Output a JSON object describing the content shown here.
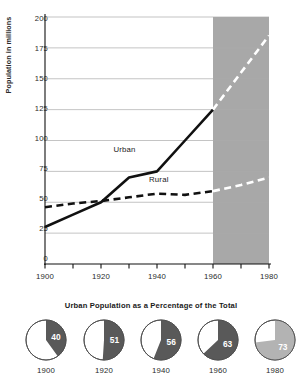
{
  "chart_data": [
    {
      "type": "line",
      "title": "",
      "xlabel": "",
      "ylabel": "Population in millions",
      "xlim": [
        1900,
        1980
      ],
      "ylim": [
        0,
        200
      ],
      "grid": true,
      "yticks": [
        0,
        25,
        50,
        75,
        100,
        125,
        150,
        175,
        200
      ],
      "ytick_labels": [
        "0",
        "25",
        "50",
        "75",
        "100",
        "125",
        "150",
        "175",
        "200"
      ],
      "xticks": [
        1900,
        1910,
        1920,
        1930,
        1940,
        1950,
        1960,
        1970,
        1980
      ],
      "xtick_labels": [
        "1900",
        "1920",
        "1940",
        "1960",
        "1980"
      ],
      "xtick_label_values": [
        1900,
        1920,
        1940,
        1960,
        1980
      ],
      "projection_band": {
        "from": 1960,
        "to": 1980,
        "color": "#a8a8a8"
      },
      "series": [
        {
          "name": "Urban",
          "style": "solid",
          "color": "#111111",
          "projected_style": "dashed",
          "projected_color": "#ffffff",
          "x": [
            1900,
            1910,
            1920,
            1930,
            1940,
            1950,
            1960,
            1970,
            1980
          ],
          "values": [
            30,
            40,
            50,
            70,
            75,
            100,
            125,
            155,
            185
          ],
          "label": "Urban",
          "label_x": 1928,
          "label_y": 92
        },
        {
          "name": "Rural",
          "style": "dashed",
          "color": "#111111",
          "projected_style": "dashed",
          "projected_color": "#ffffff",
          "x": [
            1900,
            1910,
            1920,
            1930,
            1940,
            1950,
            1960,
            1970,
            1980
          ],
          "values": [
            46,
            49,
            51,
            54,
            57,
            56,
            59,
            64,
            70
          ],
          "label": "Rural",
          "label_x": 1940,
          "label_y": 68
        }
      ]
    },
    {
      "type": "pie",
      "title": "Urban Population as a Percentage of the Total",
      "slice_colors": [
        "#595959",
        "#ffffff"
      ],
      "charts": [
        {
          "year": "1900",
          "value": 40,
          "value_label": "40",
          "fill": "#595959",
          "rest": "#ffffff"
        },
        {
          "year": "1920",
          "value": 51,
          "value_label": "51",
          "fill": "#595959",
          "rest": "#ffffff"
        },
        {
          "year": "1940",
          "value": 56,
          "value_label": "56",
          "fill": "#595959",
          "rest": "#ffffff"
        },
        {
          "year": "1960",
          "value": 63,
          "value_label": "63",
          "fill": "#595959",
          "rest": "#ffffff"
        },
        {
          "year": "1980",
          "value": 73,
          "value_label": "73",
          "fill": "#b3b3b3",
          "rest": "#ffffff"
        }
      ]
    }
  ],
  "line_chart": {
    "ylabel": "Population in millions",
    "ytick_labels": [
      "200",
      "175",
      "150",
      "125",
      "100",
      "75",
      "50",
      "25",
      "0"
    ],
    "xtick_labels": [
      "1900",
      "1920",
      "1940",
      "1960",
      "1980"
    ],
    "urban_label": "Urban",
    "rural_label": "Rural"
  },
  "pie_chart": {
    "title": "Urban Population as a Percentage of the Total",
    "items": [
      {
        "year": "1900",
        "value_label": "40"
      },
      {
        "year": "1920",
        "value_label": "51"
      },
      {
        "year": "1940",
        "value_label": "56"
      },
      {
        "year": "1960",
        "value_label": "63"
      },
      {
        "year": "1980",
        "value_label": "73"
      }
    ]
  },
  "colors": {
    "band": "#a8a8a8",
    "line": "#111111",
    "projection_line": "#ffffff",
    "pie_dark": "#595959",
    "pie_light": "#b3b3b3",
    "grid": "#aaaaaa"
  }
}
